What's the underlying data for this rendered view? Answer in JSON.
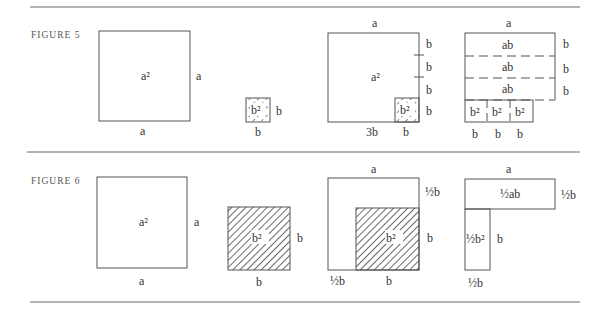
{
  "figures": [
    {
      "caption": "FIGURE 5",
      "panel1": {
        "area": "a²",
        "side_right": "a",
        "side_bottom": "a"
      },
      "panel2": {
        "area": "b²",
        "side_right": "b",
        "side_bottom": "b"
      },
      "panel3": {
        "area": "a²",
        "inner_area": "b²",
        "top": "a",
        "right": [
          "b",
          "b",
          "b",
          "b"
        ],
        "bottom": [
          "3b",
          "b"
        ]
      },
      "panel4": {
        "top": "a",
        "strips": [
          "ab",
          "ab",
          "ab"
        ],
        "right": [
          "b",
          "b",
          "b"
        ],
        "small": [
          "b²",
          "b²",
          "b²"
        ],
        "bottom": [
          "b",
          "b",
          "b"
        ]
      }
    },
    {
      "caption": "FIGURE 6",
      "panel1": {
        "area": "a²",
        "side_right": "a",
        "side_bottom": "a"
      },
      "panel2": {
        "area": "b²",
        "side_right": "b",
        "side_bottom": "b"
      },
      "panel3": {
        "inner_area": "b²",
        "top": "a",
        "right": [
          "½b",
          "b"
        ],
        "bottom": [
          "½b",
          "b"
        ]
      },
      "panel4": {
        "top": "a",
        "top_area": "½ab",
        "top_right": "½b",
        "side_area": "½b²",
        "side_right": "b",
        "bottom": "½b"
      }
    }
  ]
}
